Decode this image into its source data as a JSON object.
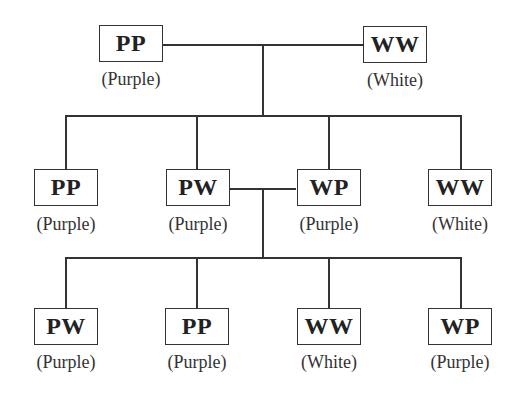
{
  "diagram": {
    "type": "genetic-cross-pedigree",
    "parents": [
      {
        "genotype": "PP",
        "phenotype": "(Purple)"
      },
      {
        "genotype": "WW",
        "phenotype": "(White)"
      }
    ],
    "f1": [
      {
        "genotype": "PP",
        "phenotype": "(Purple)"
      },
      {
        "genotype": "PW",
        "phenotype": "(Purple)"
      },
      {
        "genotype": "WP",
        "phenotype": "(Purple)"
      },
      {
        "genotype": "WW",
        "phenotype": "(White)"
      }
    ],
    "f2": [
      {
        "genotype": "PW",
        "phenotype": "(Purple)"
      },
      {
        "genotype": "PP",
        "phenotype": "(Purple)"
      },
      {
        "genotype": "WW",
        "phenotype": "(White)"
      },
      {
        "genotype": "WP",
        "phenotype": "(Purple)"
      }
    ],
    "colors": {
      "line": "#333333",
      "text": "#222222",
      "background": "#ffffff"
    }
  }
}
